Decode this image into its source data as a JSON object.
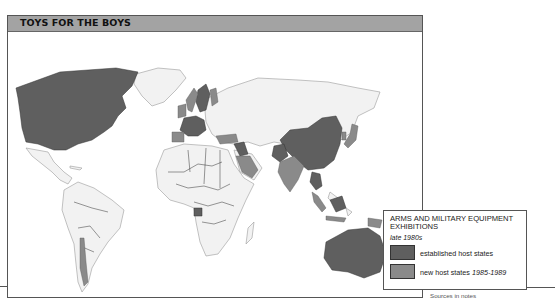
{
  "title": "TOYS FOR THE BOYS",
  "colors": {
    "header_bg": "#a3a3a3",
    "land": "#f2f2f2",
    "coast": "#9a9a9a",
    "border": "#333333",
    "established": "#5f5f5f",
    "new": "#8a8a8a",
    "frame": "#555555"
  },
  "legend": {
    "title": "ARMS AND MILITARY EQUIPMENT EXHIBITIONS",
    "subtitle": "late 1980s",
    "items": [
      {
        "label": "established host states",
        "label_suffix": "",
        "color": "#5f5f5f"
      },
      {
        "label": "new host states ",
        "label_suffix": "1985-1989",
        "color": "#8a8a8a"
      }
    ]
  },
  "map_data": {
    "established_host_states": [
      "Canada",
      "USA",
      "France",
      "West Germany",
      "Switzerland",
      "Italy",
      "Sweden",
      "Iraq",
      "China",
      "Pakistan",
      "Thailand",
      "Malaysia (Borneo)",
      "Australia",
      "Gabon"
    ],
    "new_host_states_1985_1989": [
      "United Kingdom",
      "Spain",
      "Norway",
      "Finland",
      "Turkey",
      "Saudi Arabia",
      "India",
      "Japan",
      "South Korea",
      "Indonesia",
      "Papua New Guinea",
      "Chile",
      "New Zealand"
    ]
  },
  "footer": {
    "sources": "Sources in notes"
  }
}
